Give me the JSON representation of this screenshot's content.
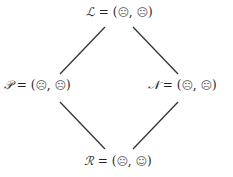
{
  "nodes": {
    "top": {
      "symbol": "ℒ",
      "eq": " = (",
      "a": "☹",
      "sep": ", ",
      "b": "☹",
      "close": ")"
    },
    "left": {
      "symbol": "𝒫",
      "eq": " = (",
      "a": "☹",
      "sep": ", ",
      "b": "☹",
      "close": ")"
    },
    "right": {
      "symbol": "𝒩",
      "eq": " = (",
      "a": "☹",
      "sep": ", ",
      "b": "☹",
      "close": ")"
    },
    "bottom": {
      "symbol": "ℛ",
      "eq": " = (",
      "a": "☹",
      "sep": ", ",
      "b": "☺",
      "close": ")"
    }
  },
  "edges": [
    {
      "from": "top",
      "to": "left"
    },
    {
      "from": "top",
      "to": "right"
    },
    {
      "from": "left",
      "to": "bottom"
    },
    {
      "from": "right",
      "to": "bottom"
    }
  ],
  "colors": {
    "line": "#333333",
    "text": "#222222"
  }
}
